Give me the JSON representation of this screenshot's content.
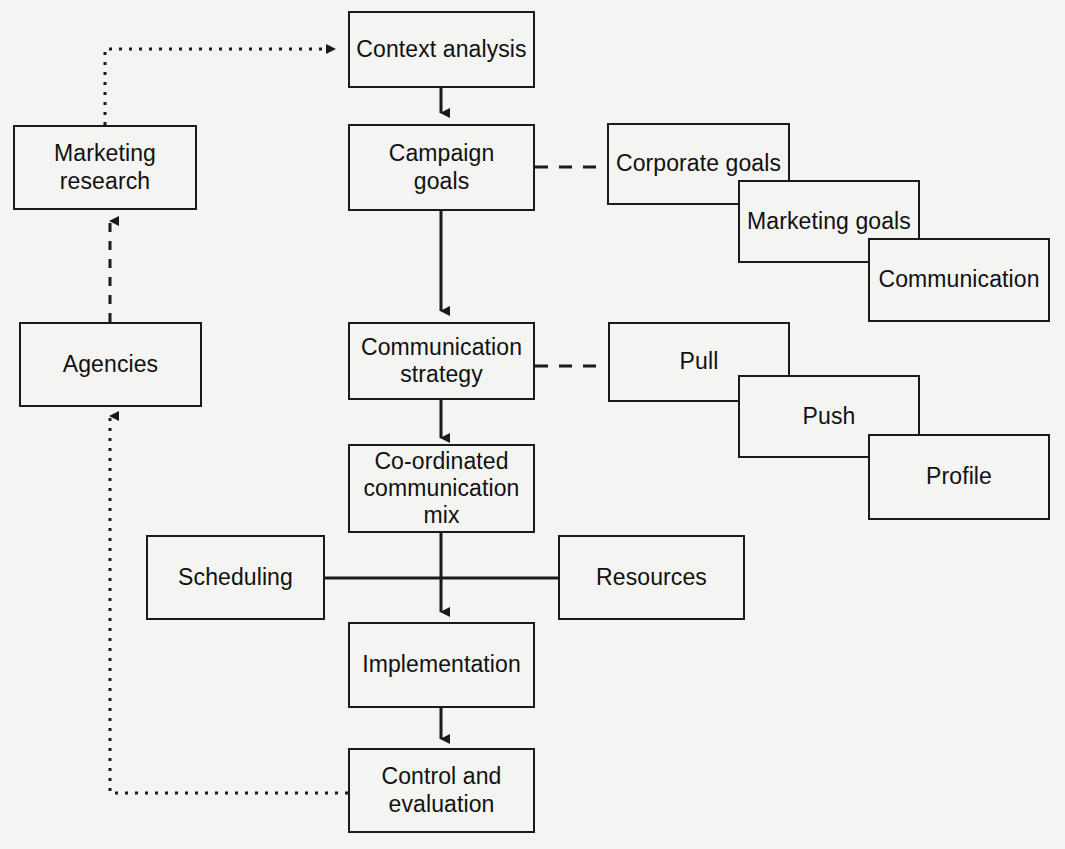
{
  "diagram": {
    "background_color": "#f4f4f2",
    "line_color": "#1a1a1a",
    "text_color": "#111111",
    "nodes": {
      "context_analysis": "Context analysis",
      "campaign_goals": "Campaign\ngoals",
      "communication_strategy": "Communication\nstrategy",
      "coordinated_mix": "Co-ordinated\ncommunication\nmix",
      "implementation": "Implementation",
      "control_evaluation": "Control and\nevaluation",
      "marketing_research": "Marketing\nresearch",
      "agencies": "Agencies",
      "scheduling": "Scheduling",
      "resources": "Resources",
      "corporate_goals": "Corporate goals",
      "marketing_goals": "Marketing goals",
      "communication": "Communication",
      "pull": "Pull",
      "push": "Push",
      "profile": "Profile"
    },
    "connections": [
      {
        "from": "marketing_research",
        "to": "context_analysis",
        "style": "dotted",
        "arrow": true
      },
      {
        "from": "context_analysis",
        "to": "campaign_goals",
        "style": "solid",
        "arrow": true
      },
      {
        "from": "campaign_goals",
        "to": "corporate_goals",
        "style": "dashed",
        "arrow": false
      },
      {
        "from": "campaign_goals",
        "to": "communication_strategy",
        "style": "solid",
        "arrow": true
      },
      {
        "from": "communication_strategy",
        "to": "pull",
        "style": "dashed",
        "arrow": false
      },
      {
        "from": "communication_strategy",
        "to": "coordinated_mix",
        "style": "solid",
        "arrow": true
      },
      {
        "from": "coordinated_mix",
        "to": "implementation",
        "style": "solid",
        "arrow": true
      },
      {
        "from": "scheduling",
        "to": "resources",
        "style": "solid",
        "arrow": false
      },
      {
        "from": "implementation",
        "to": "control_evaluation",
        "style": "solid",
        "arrow": true
      },
      {
        "from": "control_evaluation",
        "to": "agencies",
        "style": "dotted",
        "arrow": true
      },
      {
        "from": "agencies",
        "to": "marketing_research",
        "style": "dashed",
        "arrow": true
      }
    ]
  }
}
